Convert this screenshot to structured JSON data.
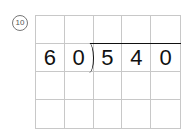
{
  "problem": {
    "number": "10",
    "divisor": [
      "6",
      "0"
    ],
    "dividend": [
      "5",
      "4",
      "0"
    ]
  },
  "grid": {
    "rows": 4,
    "cols": 5
  }
}
